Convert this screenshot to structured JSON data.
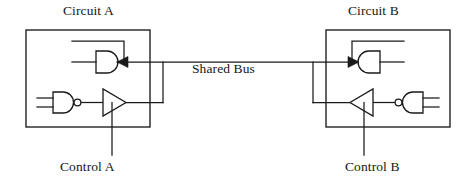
{
  "diagram": {
    "type": "logic-circuit-block-diagram",
    "stroke_color": "#1a1a1a",
    "background_color": "#ffffff"
  },
  "labels": {
    "circuit_a": "Circuit A",
    "circuit_b": "Circuit B",
    "shared_bus": "Shared Bus",
    "control_a": "Control A",
    "control_b": "Control B"
  },
  "blocks": [
    {
      "name": "Circuit A",
      "x": 26,
      "y": 30,
      "width": 124,
      "height": 97,
      "gates": [
        {
          "kind": "and-gate",
          "role": "bus-receiver",
          "orientation": "input-left",
          "has_feedback_loop": true,
          "has_bus_arrowhead": true
        },
        {
          "kind": "nand-gate",
          "role": "driver-logic",
          "orientation": "input-left",
          "inputs": 2,
          "has_bubble": true
        },
        {
          "kind": "buffer-triangle",
          "role": "tri-state-bus-driver",
          "orientation": "pointing-right",
          "has_control_input": true
        }
      ]
    },
    {
      "name": "Circuit B",
      "x": 326,
      "y": 30,
      "width": 124,
      "height": 97,
      "gates": [
        {
          "kind": "and-gate",
          "role": "bus-receiver",
          "orientation": "input-right-mirrored",
          "has_feedback_loop": true,
          "has_bus_arrowhead": true
        },
        {
          "kind": "nand-gate",
          "role": "driver-logic",
          "orientation": "input-right-mirrored",
          "inputs": 2,
          "has_bubble": true
        },
        {
          "kind": "buffer-triangle",
          "role": "tri-state-bus-driver",
          "orientation": "pointing-left",
          "has_control_input": true
        }
      ]
    }
  ],
  "bus": {
    "name": "Shared Bus",
    "y": 62,
    "x_start": 117,
    "x_end": 352,
    "connects": [
      "Circuit A",
      "Circuit B"
    ]
  }
}
